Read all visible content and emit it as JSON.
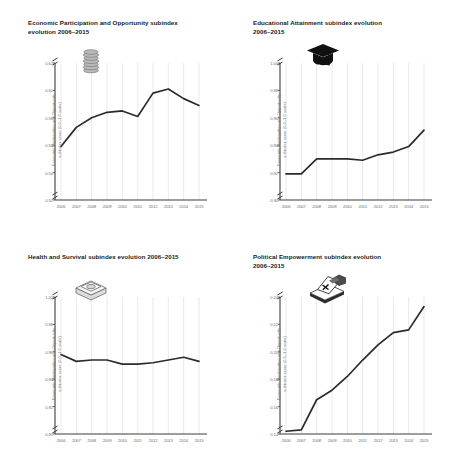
{
  "figure": {
    "common_ylabel": "Economic Participation and Opportunity\nsubindex score (0.0–1.0 scale)",
    "years": [
      "2006",
      "2007",
      "2008",
      "2009",
      "2010",
      "2011",
      "2012",
      "2013",
      "2014",
      "2015"
    ],
    "line_color": "#2b2b2b",
    "grid_color": "#e3e3e3",
    "axis_color": "#3d3d3d",
    "tick_text_color": "#6f6f6f"
  },
  "chart_data": [
    {
      "type": "line",
      "panel": "top-left",
      "title": "Economic Participation and Opportunity subindex\nevolution 2006–2015",
      "icon": "coin-stack-icon",
      "xlabel": "",
      "ylabel": "Economic Participation and Opportunity\nsubindex score (0.0–1.0 scale)",
      "categories": [
        "2006",
        "2007",
        "2008",
        "2009",
        "2010",
        "2011",
        "2012",
        "2013",
        "2014",
        "2015"
      ],
      "values": [
        0.559,
        0.573,
        0.58,
        0.584,
        0.585,
        0.581,
        0.598,
        0.601,
        0.594,
        0.589
      ],
      "ylim": [
        0.52,
        0.62
      ],
      "yticks": [
        "0.62",
        "0.60",
        "0.58",
        "0.56",
        "0.54",
        "0.52"
      ],
      "ytick_values": [
        0.62,
        0.6,
        0.58,
        0.56,
        0.54,
        0.52
      ],
      "axis_break": true,
      "grid": "vertical"
    },
    {
      "type": "line",
      "panel": "top-right",
      "title": "Educational Attainment subindex evolution\n2006–2015",
      "icon": "graduation-cap-icon",
      "xlabel": "",
      "ylabel": "Economic Participation and Opportunity\nsubindex score (0.0–1.0 scale)",
      "categories": [
        "2006",
        "2007",
        "2008",
        "2009",
        "2010",
        "2011",
        "2012",
        "2013",
        "2014",
        "2015"
      ],
      "values": [
        0.919,
        0.919,
        0.93,
        0.93,
        0.93,
        0.929,
        0.933,
        0.935,
        0.939,
        0.951
      ],
      "ylim": [
        0.9,
        1.0
      ],
      "yticks": [
        "1.00",
        "0.98",
        "0.96",
        "0.94",
        "0.92",
        "0.90"
      ],
      "ytick_values": [
        1.0,
        0.98,
        0.96,
        0.94,
        0.92,
        0.9
      ],
      "axis_break": true,
      "grid": "vertical"
    },
    {
      "type": "line",
      "panel": "bottom-left",
      "title": "Health and Survival subindex evolution 2006–2015",
      "icon": "pill-box-icon",
      "xlabel": "",
      "ylabel": "Economic Participation and Opportunity\nsubindex score (0.0–1.0 scale)",
      "categories": [
        "2006",
        "2007",
        "2008",
        "2009",
        "2010",
        "2011",
        "2012",
        "2013",
        "2014",
        "2015"
      ],
      "values": [
        0.958,
        0.953,
        0.954,
        0.954,
        0.951,
        0.951,
        0.952,
        0.954,
        0.956,
        0.953
      ],
      "ylim": [
        0.9,
        1.0
      ],
      "yticks": [
        "1.00",
        "0.98",
        "0.96",
        "0.94",
        "0.92",
        "0.90"
      ],
      "ytick_values": [
        1.0,
        0.98,
        0.96,
        0.94,
        0.92,
        0.9
      ],
      "axis_break": true,
      "grid": "vertical"
    },
    {
      "type": "line",
      "panel": "bottom-right",
      "title": "Political Empowerment subindex evolution\n2006–2015",
      "icon": "ballot-box-icon",
      "xlabel": "",
      "ylabel": "Economic Participation and Opportunity\nsubindex score (0.0–1.0 scale)",
      "categories": [
        "2006",
        "2007",
        "2008",
        "2009",
        "2010",
        "2011",
        "2012",
        "2013",
        "2014",
        "2015"
      ],
      "values": [
        0.142,
        0.143,
        0.165,
        0.172,
        0.182,
        0.194,
        0.205,
        0.214,
        0.216,
        0.233
      ],
      "ylim": [
        0.14,
        0.24
      ],
      "yticks": [
        "0.24",
        "0.22",
        "0.20",
        "0.18",
        "0.16",
        "0.14"
      ],
      "ytick_values": [
        0.24,
        0.22,
        0.2,
        0.18,
        0.16,
        0.14
      ],
      "axis_break": true,
      "grid": "vertical"
    }
  ]
}
